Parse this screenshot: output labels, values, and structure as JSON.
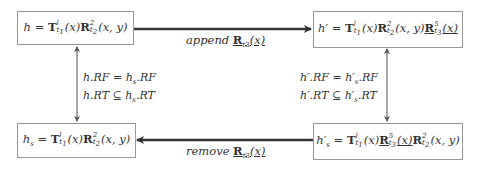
{
  "diagram": {
    "type": "commutative-state-diagram",
    "nodes": {
      "h": {
        "lhs": "h",
        "expr": "h = T^l_{t1}(x) R^2_{t2}(x, y)"
      },
      "h_prime": {
        "lhs": "h′",
        "expr": "h′ = T^l_{t1}(x) R^2_{t2}(x, y) R^5_{t3}(x)",
        "underlined_term": "R^5_{t3}(x)"
      },
      "h_s": {
        "lhs": "h_s",
        "expr": "h_s = T^l_{t1}(x) R^2_{t2}(x, y)"
      },
      "h_s_prime": {
        "lhs": "h′_s",
        "expr": "h′_s = T^l_{t1}(x) R^5_{t3}(x) R^2_{t2}(x, y)",
        "underlined_term": "R^5_{t3}(x)"
      }
    },
    "edges": [
      {
        "from": "h",
        "to": "h_prime",
        "label_word": "append",
        "label_term": "R",
        "label_sub": "t3",
        "label_arg": "(x)",
        "direction": "right"
      },
      {
        "from": "h_s_prime",
        "to": "h_s",
        "label_word": "remove",
        "label_term": "R",
        "label_sub": "t3",
        "label_arg": "(x)",
        "direction": "left"
      },
      {
        "from": "h",
        "to": "h_s",
        "bidirectional": true,
        "conditions": [
          "h.RF = h_s.RF",
          "h.RT ⊆ h_s.RT"
        ]
      },
      {
        "from": "h_prime",
        "to": "h_s_prime",
        "bidirectional": true,
        "conditions": [
          "h′.RF = h′_s.RF",
          "h′.RT ⊆ h′_s.RT"
        ]
      }
    ]
  },
  "text": {
    "T": "T",
    "R": "R",
    "eq": " = ",
    "x": "(x)",
    "xy": "(x, y)",
    "sup_l": "l",
    "sup_2": "2",
    "sup_5": "5",
    "sub_t1": "t",
    "sub_t1_i": "1",
    "sub_t2": "t",
    "sub_t2_i": "2",
    "sub_t3": "t",
    "sub_t3_i": "3",
    "h": "h",
    "h_prime": "h′",
    "h_s": "h",
    "s": "s",
    "append": "append",
    "remove": "remove",
    "cond_left_1": "h.RF = h",
    "cond_left_1b": ".RF",
    "cond_left_2": "h.RT ⊆ h",
    "cond_left_2b": ".RT",
    "cond_right_1": "h′.RF = h′",
    "cond_right_1b": ".RF",
    "cond_right_2": "h′.RT ⊆ h′",
    "cond_right_2b": ".RT"
  }
}
